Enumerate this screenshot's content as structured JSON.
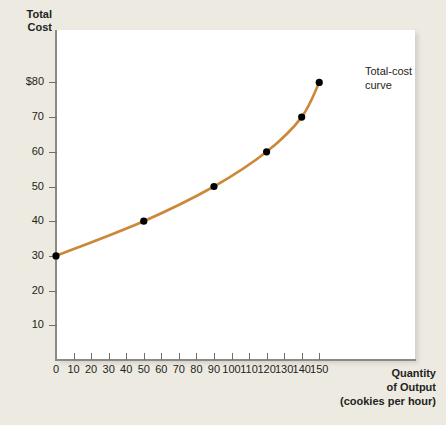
{
  "figure": {
    "background_color": "#edeae2",
    "panel_color": "#ffffff",
    "axis_color": "#8b8a84",
    "text_color": "#231f20"
  },
  "axis_titles": {
    "y_line1": "Total",
    "y_line2": "Cost",
    "x_line1": "Quantity",
    "x_line2": "of Output",
    "x_line3": "(cookies per hour)"
  },
  "annotation": {
    "line1": "Total-cost",
    "line2": "curve"
  },
  "chart_data": {
    "type": "line",
    "title": "",
    "subtitle": "",
    "xlabel": "Quantity of Output (cookies per hour)",
    "ylabel": "Total Cost",
    "xlim": [
      0,
      158
    ],
    "ylim": [
      0,
      95
    ],
    "grid": false,
    "legend": "none",
    "curve_color": "#cc8839",
    "marker_color": "#000000",
    "x_ticks": [
      0,
      10,
      20,
      30,
      40,
      50,
      60,
      70,
      80,
      90,
      100,
      110,
      120,
      130,
      140,
      150
    ],
    "x_tick_labels": [
      "0",
      "10",
      "20",
      "30",
      "40",
      "50",
      "60",
      "70",
      "80",
      "90",
      "100",
      "110",
      "120",
      "130",
      "140",
      "150"
    ],
    "y_ticks": [
      10,
      20,
      30,
      40,
      50,
      60,
      70,
      80
    ],
    "y_tick_labels": [
      "10",
      "20",
      "30",
      "40",
      "50",
      "60",
      "70",
      "$80"
    ],
    "series": [
      {
        "name": "Total-cost curve",
        "x": [
          0,
          50,
          90,
          120,
          140,
          150
        ],
        "values": [
          30,
          40,
          50,
          60,
          70,
          80
        ],
        "points": [
          {
            "x": 0,
            "y": 30
          },
          {
            "x": 50,
            "y": 40
          },
          {
            "x": 90,
            "y": 50
          },
          {
            "x": 120,
            "y": 60
          },
          {
            "x": 140,
            "y": 70
          },
          {
            "x": 150,
            "y": 80
          }
        ]
      }
    ],
    "annotations": [
      {
        "text": "Total-cost curve",
        "attached_to_x": 150,
        "attached_to_y": 80
      }
    ]
  }
}
